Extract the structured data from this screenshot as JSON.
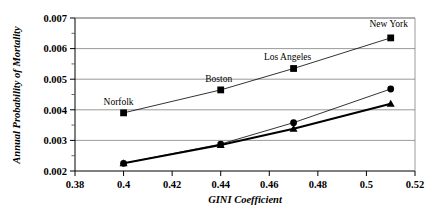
{
  "chart_data": {
    "type": "line",
    "title": "",
    "xlabel": "GINI Coefficient",
    "ylabel": "Annual Probability of Mortality",
    "xlim": [
      0.38,
      0.52
    ],
    "ylim": [
      0.002,
      0.007
    ],
    "xticks": [
      "0.38",
      "0.4",
      "0.42",
      "0.44",
      "0.46",
      "0.48",
      "0.5",
      "0.52"
    ],
    "xtick_values": [
      0.38,
      0.4,
      0.42,
      0.44,
      0.46,
      0.48,
      0.5,
      0.52
    ],
    "yticks": [
      "0.002",
      "0.003",
      "0.004",
      "0.005",
      "0.006",
      "0.007"
    ],
    "ytick_values": [
      0.002,
      0.003,
      0.004,
      0.005,
      0.006,
      0.007
    ],
    "y_minor_values": [
      0.0025,
      0.0035,
      0.0045,
      0.0055,
      0.0065
    ],
    "grid": "horizontal",
    "legend": "none",
    "x": [
      0.4,
      0.44,
      0.47,
      0.51
    ],
    "series": [
      {
        "name": "series-squares",
        "marker": "square",
        "line_width": 0.8,
        "color": "#000000",
        "values": [
          0.0039,
          0.00465,
          0.00535,
          0.00635
        ]
      },
      {
        "name": "series-circles",
        "marker": "circle",
        "line_width": 0.8,
        "color": "#000000",
        "values": [
          0.00225,
          0.00288,
          0.00358,
          0.00468
        ]
      },
      {
        "name": "series-triangles",
        "marker": "triangle",
        "line_width": 2.0,
        "color": "#000000",
        "values": [
          0.00225,
          0.00285,
          0.00338,
          0.0042
        ]
      }
    ],
    "annotations": [
      {
        "text": "Norfolk",
        "x": 0.4,
        "y": 0.0039,
        "dx": -5,
        "dy": -8
      },
      {
        "text": "Boston",
        "x": 0.44,
        "y": 0.00465,
        "dx": -2,
        "dy": -8
      },
      {
        "text": "Los Angeles",
        "x": 0.47,
        "y": 0.00535,
        "dx": -6,
        "dy": -8
      },
      {
        "text": "New York",
        "x": 0.51,
        "y": 0.00635,
        "dx": -2,
        "dy": -11
      }
    ]
  }
}
